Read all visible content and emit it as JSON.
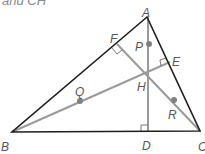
{
  "caption": "and CH",
  "colors": {
    "triangle": "#1e1e1e",
    "altitude": "#9a9a9a",
    "point": "#808080",
    "label": "#555555"
  },
  "vertices": {
    "A": {
      "label": "A",
      "x": 147,
      "y": 17
    },
    "B": {
      "label": "B",
      "x": 12,
      "y": 132
    },
    "C": {
      "label": "C",
      "x": 200,
      "y": 131
    }
  },
  "feet": {
    "D": {
      "label": "D",
      "x": 148,
      "y": 132
    },
    "E": {
      "label": "E",
      "x": 170,
      "y": 62
    },
    "F": {
      "label": "F",
      "x": 117,
      "y": 44
    }
  },
  "orthocenter": {
    "label": "H",
    "x": 148,
    "y": 73
  },
  "midpoints": {
    "P": {
      "label": "P",
      "x": 149,
      "y": 44
    },
    "Q": {
      "label": "Q",
      "x": 80,
      "y": 101
    },
    "R": {
      "label": "R",
      "x": 174,
      "y": 100
    }
  }
}
